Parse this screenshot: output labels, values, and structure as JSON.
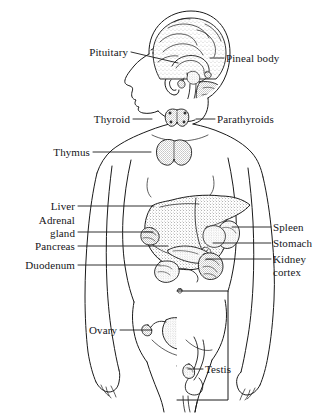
{
  "figure": {
    "style": "black-and-white-line-drawing-with-stippling",
    "background_color": "#ffffff",
    "line_color": "#1a1a1a",
    "width": 333,
    "height": 415
  },
  "labels": [
    {
      "id": "pituitary",
      "text": "Pituitary",
      "align": "right",
      "x": 72,
      "y": 46,
      "width": 56,
      "leader": {
        "x1": 131,
        "y1": 52,
        "x2": 178,
        "y2": 63
      }
    },
    {
      "id": "pineal-body",
      "text": "Pineal body",
      "align": "left",
      "x": 226,
      "y": 52,
      "width": 70,
      "leader": {
        "x1": 210,
        "y1": 58,
        "x2": 224,
        "y2": 58
      }
    },
    {
      "id": "thyroid",
      "text": "Thyroid",
      "align": "right",
      "x": 86,
      "y": 113,
      "width": 44,
      "leader": {
        "x1": 133,
        "y1": 119,
        "x2": 152,
        "y2": 119
      }
    },
    {
      "id": "parathyroids",
      "text": "Parathyroids",
      "align": "left",
      "x": 217,
      "y": 113,
      "width": 78,
      "leader": {
        "x1": 196,
        "y1": 119,
        "x2": 215,
        "y2": 119
      }
    },
    {
      "id": "thymus",
      "text": "Thymus",
      "align": "right",
      "x": 43,
      "y": 146,
      "width": 47,
      "leader": {
        "x1": 93,
        "y1": 152,
        "x2": 151,
        "y2": 152
      }
    },
    {
      "id": "liver",
      "text": "Liver",
      "align": "right",
      "x": 44,
      "y": 200,
      "width": 31,
      "leader": {
        "x1": 78,
        "y1": 206,
        "x2": 154,
        "y2": 206
      }
    },
    {
      "id": "adrenal-gland",
      "text": "Adrenal\ngland",
      "align": "right",
      "x": 26,
      "y": 214,
      "width": 49,
      "leader": {
        "x1": 78,
        "y1": 232,
        "x2": 153,
        "y2": 232
      }
    },
    {
      "id": "pancreas",
      "text": "Pancreas",
      "align": "right",
      "x": 19,
      "y": 240,
      "width": 56,
      "leader": {
        "x1": 78,
        "y1": 246,
        "x2": 168,
        "y2": 246
      }
    },
    {
      "id": "duodenum",
      "text": "Duodenum",
      "align": "right",
      "x": 12,
      "y": 259,
      "width": 63,
      "leader": {
        "x1": 78,
        "y1": 265,
        "x2": 160,
        "y2": 265
      }
    },
    {
      "id": "spleen",
      "text": "Spleen",
      "align": "left",
      "x": 273,
      "y": 221,
      "width": 41,
      "leader": {
        "x1": 232,
        "y1": 227,
        "x2": 271,
        "y2": 227
      }
    },
    {
      "id": "stomach",
      "text": "Stomach",
      "align": "left",
      "x": 273,
      "y": 237,
      "width": 52,
      "leader": {
        "x1": 213,
        "y1": 243,
        "x2": 271,
        "y2": 243
      }
    },
    {
      "id": "kidney-cortex",
      "text": "Kidney\ncortex",
      "align": "left",
      "x": 273,
      "y": 253,
      "width": 45,
      "leader": {
        "x1": 206,
        "y1": 259,
        "x2": 271,
        "y2": 259
      }
    },
    {
      "id": "ovary",
      "text": "Ovary",
      "align": "right",
      "x": 81,
      "y": 324,
      "width": 36,
      "leader": {
        "x1": 120,
        "y1": 330,
        "x2": 152,
        "y2": 330
      }
    },
    {
      "id": "testis",
      "text": "Testis",
      "align": "left",
      "x": 205,
      "y": 363,
      "width": 36,
      "leader": {
        "x1": 188,
        "y1": 369,
        "x2": 203,
        "y2": 369
      }
    }
  ],
  "organs": [
    {
      "id": "brain",
      "name": "brain-sagittal-section"
    },
    {
      "id": "pituitary-gland",
      "name": "pituitary-gland"
    },
    {
      "id": "pineal-gland",
      "name": "pineal-gland"
    },
    {
      "id": "thyroid-gland",
      "name": "thyroid-gland"
    },
    {
      "id": "parathyroid-glands",
      "name": "parathyroid-glands"
    },
    {
      "id": "thymus-gland",
      "name": "thymus-gland"
    },
    {
      "id": "liver-organ",
      "name": "liver"
    },
    {
      "id": "adrenal-glands",
      "name": "adrenal-glands"
    },
    {
      "id": "pancreas-organ",
      "name": "pancreas"
    },
    {
      "id": "duodenum-organ",
      "name": "duodenum"
    },
    {
      "id": "spleen-organ",
      "name": "spleen"
    },
    {
      "id": "stomach-organ",
      "name": "stomach"
    },
    {
      "id": "kidney-organ",
      "name": "kidney-cortex"
    },
    {
      "id": "ovary-organ",
      "name": "ovary-and-uterus"
    },
    {
      "id": "testis-organ",
      "name": "testis-inset"
    }
  ],
  "inset": {
    "id": "male-pelvis-inset",
    "description": "rectangular inset showing male pelvic region",
    "x": 177,
    "y": 291,
    "width": 51,
    "height": 109
  }
}
